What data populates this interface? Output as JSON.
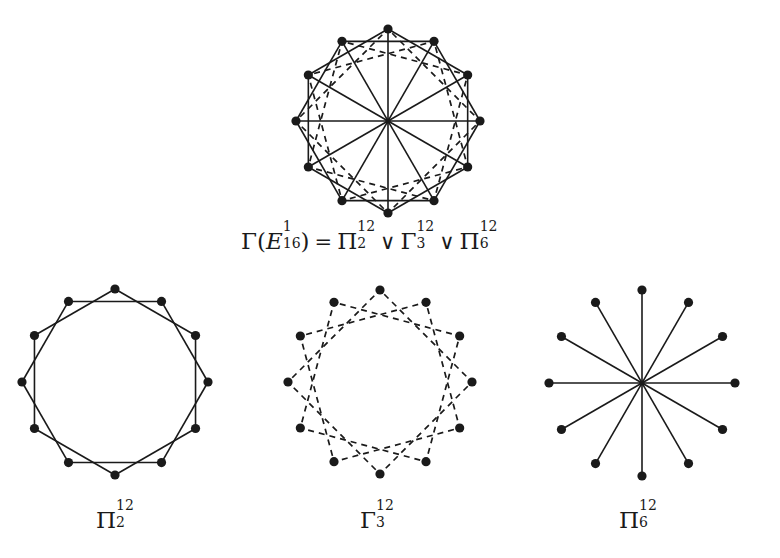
{
  "figure": {
    "vertex_count": 12,
    "colors": {
      "ink": "#1a1a1a",
      "background": "#ffffff"
    },
    "graphs": [
      {
        "id": "union",
        "center": [
          388,
          121
        ],
        "radius": 92,
        "components": [
          {
            "name": "Pi2",
            "type": "step",
            "step": 2,
            "style": "solid"
          },
          {
            "name": "Gamma3",
            "type": "step",
            "step": 3,
            "style": "dashed"
          },
          {
            "name": "Pi6",
            "type": "diameter",
            "style": "solid"
          }
        ]
      },
      {
        "id": "pi2",
        "center": [
          115,
          382
        ],
        "radius": 93,
        "components": [
          {
            "name": "Pi2",
            "type": "step",
            "step": 2,
            "style": "solid"
          }
        ]
      },
      {
        "id": "gamma3",
        "center": [
          380,
          382
        ],
        "radius": 92,
        "components": [
          {
            "name": "Gamma3",
            "type": "step",
            "step": 3,
            "style": "dashed"
          }
        ]
      },
      {
        "id": "pi6",
        "center": [
          642,
          383
        ],
        "radius": 93,
        "components": [
          {
            "name": "Pi6",
            "type": "diameter",
            "style": "solid"
          }
        ]
      }
    ]
  },
  "captions": {
    "top": {
      "gamma": "Γ",
      "open_paren": "(",
      "E": "E",
      "E_sup": "1",
      "E_sub": "16",
      "close_paren": ")",
      "equals": "=",
      "pi2": "Π",
      "pi2_sup": "12",
      "pi2_sub": "2",
      "vee1": "∨",
      "gamma3": "Γ",
      "gamma3_sup": "12",
      "gamma3_sub": "3",
      "vee2": "∨",
      "pi6": "Π",
      "pi6_sup": "12",
      "pi6_sub": "6"
    },
    "pi2": {
      "symbol": "Π",
      "sup": "12",
      "sub": "2"
    },
    "gamma3": {
      "symbol": "Γ",
      "sup": "12",
      "sub": "3"
    },
    "pi6": {
      "symbol": "Π",
      "sup": "12",
      "sub": "6"
    }
  }
}
